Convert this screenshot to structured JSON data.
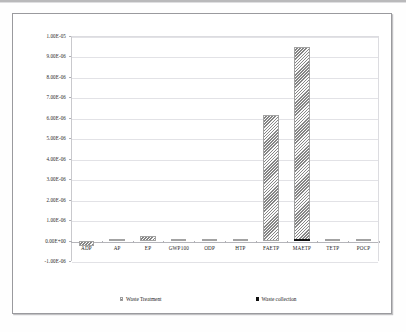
{
  "chart_data": {
    "type": "bar",
    "title": "",
    "subtitle": "",
    "xlabel": "",
    "ylabel": "",
    "grid": true,
    "legend_position": "bottom",
    "categories": [
      "ADP",
      "AP",
      "EP",
      "GWP100",
      "ODP",
      "HTP",
      "FAETP",
      "MAETP",
      "TETP",
      "POCP"
    ],
    "ylim": [
      -1e-06,
      1e-05
    ],
    "ytick_labels": [
      "1.00E-05",
      "9.00E-06",
      "8.00E-06",
      "7.00E-06",
      "6.00E-06",
      "5.00E-06",
      "4.00E-06",
      "3.00E-06",
      "2.00E-06",
      "1.00E-06",
      "0.00E+00",
      "-1.00E-06"
    ],
    "ytick_values": [
      1e-05,
      9e-06,
      8e-06,
      7e-06,
      6e-06,
      5e-06,
      4e-06,
      3e-06,
      2e-06,
      1e-06,
      0.0,
      -1e-06
    ],
    "series": [
      {
        "name": "Waste Treatment",
        "color": "#bfbfbf",
        "pattern": "diagonal-hatch",
        "values": [
          -2.6e-07,
          2e-08,
          2.2e-07,
          9e-08,
          1.5e-08,
          1e-08,
          6.15e-06,
          9.45e-06,
          1.2e-08,
          8e-09
        ]
      },
      {
        "name": "Waste collection",
        "color": "#111111",
        "pattern": "solid",
        "values": [
          0.0,
          0.0,
          0.0,
          0.0,
          0.0,
          0.0,
          0.0,
          9e-08,
          0.0,
          0.0
        ]
      }
    ]
  },
  "legend": {
    "entries": [
      {
        "label": "Waste Treatment",
        "marker": "hatched-square"
      },
      {
        "label": "Waste collection",
        "marker": "black-square"
      }
    ]
  }
}
